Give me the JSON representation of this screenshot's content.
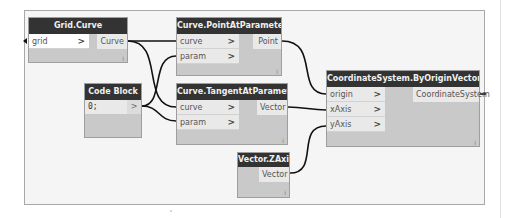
{
  "graph": {
    "nodes": [
      {
        "id": "grid_curve",
        "title": "Grid.Curve",
        "inputs": [
          {
            "label": "grid"
          }
        ],
        "outputs": [
          {
            "label": "Curve"
          }
        ],
        "footer": "i"
      },
      {
        "id": "point_at_param",
        "title": "Curve.PointAtParameter",
        "inputs": [
          {
            "label": "curve"
          },
          {
            "label": "param"
          }
        ],
        "outputs": [
          {
            "label": "Point"
          }
        ],
        "footer": "i"
      },
      {
        "id": "code_block",
        "title": "Code Block",
        "code": "0;",
        "output_glyph": ">"
      },
      {
        "id": "tangent_at_param",
        "title": "Curve.TangentAtParameter",
        "inputs": [
          {
            "label": "curve"
          },
          {
            "label": "param"
          }
        ],
        "outputs": [
          {
            "label": "Vector"
          }
        ],
        "footer": "i"
      },
      {
        "id": "vector_zaxis",
        "title": "Vector.ZAxis",
        "outputs": [
          {
            "label": "Vector"
          }
        ],
        "footer": "i"
      },
      {
        "id": "coord_sys",
        "title": "CoordinateSystem.ByOriginVectors",
        "inputs": [
          {
            "label": "origin"
          },
          {
            "label": "xAxis"
          },
          {
            "label": "yAxis"
          }
        ],
        "outputs": [
          {
            "label": "CoordinateSystem"
          }
        ],
        "footer": "i"
      }
    ],
    "chevron": ">",
    "colors": {
      "header": "#333333",
      "node_body": "#c9c9c9",
      "port": "#e9e9e9",
      "wire": "#111111",
      "canvas": "#f5f5f5"
    }
  }
}
